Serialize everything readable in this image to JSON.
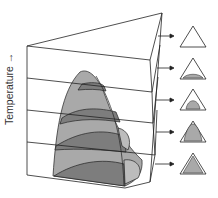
{
  "diagram": {
    "axis_label": "Temperature",
    "axis_arrow": "→",
    "colors": {
      "line": "#222222",
      "light_fill": "#a9a9a9",
      "dark_fill": "#7d7d7d",
      "background": "#ffffff"
    },
    "sections": [
      {
        "index": 1,
        "state": "empty"
      },
      {
        "index": 2,
        "state": "small-bump"
      },
      {
        "index": 3,
        "state": "medium-dome"
      },
      {
        "index": 4,
        "state": "large-dome"
      },
      {
        "index": 5,
        "state": "nearly-full"
      }
    ]
  }
}
